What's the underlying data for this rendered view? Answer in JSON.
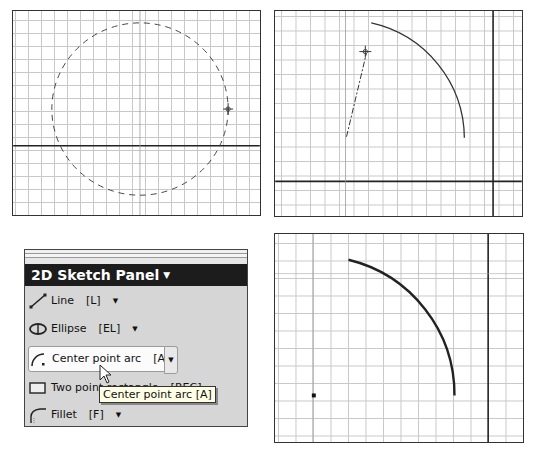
{
  "views": {
    "top_left": {
      "description": "Dashed preview circle with crosshair cursor on grid",
      "has_horizontal_axis": true
    },
    "top_right": {
      "description": "Arc preview with dash-dot radius line to cursor",
      "has_horizontal_axis": true,
      "has_vertical_axis": true
    },
    "bottom_right": {
      "description": "Completed center point arc with center point",
      "has_vertical_axis": true
    }
  },
  "sketch_panel": {
    "title": "2D Sketch Panel",
    "title_arrow": "▼",
    "items": [
      {
        "icon": "line-icon",
        "label": "Line",
        "shortcut": "[L]",
        "dropdown": "▼"
      },
      {
        "icon": "ellipse-icon",
        "label": "Ellipse",
        "shortcut": "[EL]",
        "dropdown": "▼"
      },
      {
        "icon": "center-point-arc-icon",
        "label": "Center point arc",
        "shortcut": "[A]",
        "dropdown": "▼",
        "active": true
      },
      {
        "icon": "rectangle-icon",
        "label": "Two point rectangle",
        "shortcut": "[REC]",
        "dropdown": "▼"
      },
      {
        "icon": "fillet-icon",
        "label": "Fillet",
        "shortcut": "[F]",
        "dropdown": "▼"
      }
    ]
  },
  "tooltip": {
    "text": "Center point arc [A]"
  },
  "colors": {
    "grid": "#c8c8c8",
    "border": "#333333",
    "panel_bg": "#d6d6d6",
    "title_bg": "#1c1c1c",
    "tooltip_bg": "#ffffe6"
  }
}
